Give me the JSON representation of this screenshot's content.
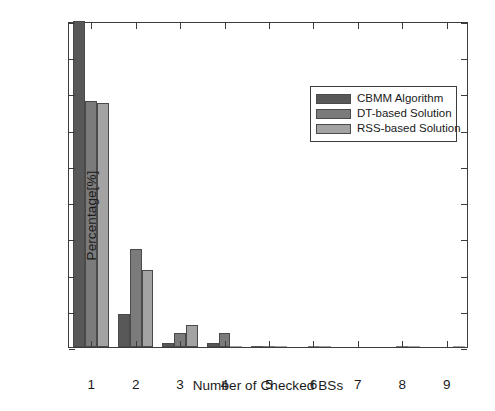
{
  "chart_data": {
    "type": "bar",
    "title": "",
    "xlabel": "Number of Checked BSs",
    "ylabel": "Percentage[%]",
    "categories": [
      "1",
      "2",
      "3",
      "4",
      "5",
      "6",
      "7",
      "8",
      "9"
    ],
    "xlim": [
      0.5,
      9.5
    ],
    "ylim": [
      0,
      90
    ],
    "ytick_labels": [
      "0",
      "10",
      "20",
      "30",
      "40",
      "50",
      "60",
      "70",
      "80",
      "90"
    ],
    "ytick_values": [
      0,
      10,
      20,
      30,
      40,
      50,
      60,
      70,
      80,
      90
    ],
    "grid": false,
    "legend_position": "upper right",
    "series": [
      {
        "name": "CBMM Algorithm",
        "color": "#585858",
        "values": [
          90,
          9,
          1,
          1.1,
          0.2,
          0,
          0,
          0,
          0
        ]
      },
      {
        "name": "DT-based Solution",
        "color": "#7b7b7b",
        "values": [
          68,
          27,
          3.8,
          4,
          0.3,
          0.2,
          0,
          0.2,
          0
        ]
      },
      {
        "name": "RSS-based Solution",
        "color": "#a3a3a3",
        "values": [
          67.3,
          21.2,
          6,
          0.3,
          0.3,
          0.1,
          0,
          0.1,
          0.3
        ]
      }
    ]
  },
  "legend": {
    "entries": [
      {
        "label": "CBMM Algorithm",
        "color": "#585858"
      },
      {
        "label": "DT-based Solution",
        "color": "#7b7b7b"
      },
      {
        "label": "RSS-based Solution",
        "color": "#a3a3a3"
      }
    ]
  },
  "axes": {
    "y_title": "Percentage[%]",
    "x_title": "Number of Checked BSs"
  },
  "colors": {
    "axis": "#3c3c3c",
    "text": "#1a1a1a",
    "background": "#ffffff",
    "series_1": "#585858",
    "series_2": "#7b7b7b",
    "series_3": "#a3a3a3"
  }
}
